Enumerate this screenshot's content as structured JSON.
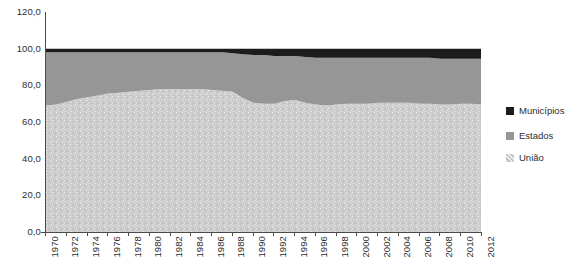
{
  "chart_data": {
    "type": "area",
    "stacked": true,
    "percent_stacked": true,
    "title": "",
    "subtitle": "",
    "xlabel": "",
    "ylabel": "",
    "grid": false,
    "legend_position": "right",
    "xlim": [
      1970,
      2012
    ],
    "ylim": [
      0,
      120
    ],
    "ytick_values": [
      0,
      20,
      40,
      60,
      80,
      100,
      120
    ],
    "ytick_labels": [
      "0,0",
      "20,0",
      "40,0",
      "60,0",
      "80,0",
      "100,0",
      "120,0"
    ],
    "xtick_labels": [
      "1970",
      "1972",
      "1974",
      "1976",
      "1978",
      "1980",
      "1982",
      "1984",
      "1986",
      "1988",
      "1990",
      "1992",
      "1994",
      "1996",
      "1998",
      "2000",
      "2002",
      "2004",
      "2006",
      "2008",
      "2010",
      "2012"
    ],
    "x": [
      1970,
      1971,
      1972,
      1973,
      1974,
      1975,
      1976,
      1977,
      1978,
      1979,
      1980,
      1981,
      1982,
      1983,
      1984,
      1985,
      1986,
      1987,
      1988,
      1989,
      1990,
      1991,
      1992,
      1993,
      1994,
      1995,
      1996,
      1997,
      1998,
      1999,
      2000,
      2001,
      2002,
      2003,
      2004,
      2005,
      2006,
      2007,
      2008,
      2009,
      2010,
      2011,
      2012
    ],
    "series": [
      {
        "name": "União",
        "color": "#c9c9c9",
        "pattern": "speckled-light",
        "values": [
          69.0,
          69.5,
          71.0,
          72.5,
          73.5,
          74.5,
          75.5,
          76.0,
          76.5,
          77.0,
          77.5,
          78.0,
          78.0,
          78.0,
          78.0,
          78.0,
          77.5,
          77.0,
          76.5,
          73.0,
          70.5,
          70.0,
          70.0,
          71.5,
          72.0,
          70.5,
          69.5,
          69.0,
          69.5,
          70.0,
          70.0,
          70.0,
          70.5,
          70.5,
          70.5,
          70.5,
          70.0,
          70.0,
          69.5,
          69.5,
          70.0,
          70.0,
          69.5
        ]
      },
      {
        "name": "Estados",
        "color": "#969696",
        "pattern": "solid-gray",
        "values": [
          29.0,
          28.5,
          27.0,
          25.5,
          24.5,
          23.5,
          22.5,
          22.0,
          21.5,
          21.0,
          20.5,
          20.0,
          20.0,
          20.0,
          20.0,
          20.0,
          20.5,
          21.0,
          21.0,
          24.0,
          26.0,
          26.5,
          26.0,
          24.5,
          24.0,
          25.0,
          25.5,
          26.0,
          25.5,
          25.0,
          25.0,
          25.0,
          24.5,
          24.5,
          24.5,
          24.5,
          25.0,
          25.0,
          25.0,
          25.0,
          24.5,
          24.5,
          25.0
        ]
      },
      {
        "name": "Municípios",
        "color": "#1c1c1c",
        "pattern": "solid-dark",
        "values": [
          2.0,
          2.0,
          2.0,
          2.0,
          2.0,
          2.0,
          2.0,
          2.0,
          2.0,
          2.0,
          2.0,
          2.0,
          2.0,
          2.0,
          2.0,
          2.0,
          2.0,
          2.0,
          2.5,
          3.0,
          3.5,
          3.5,
          4.0,
          4.0,
          4.0,
          4.5,
          5.0,
          5.0,
          5.0,
          5.0,
          5.0,
          5.0,
          5.0,
          5.0,
          5.0,
          5.0,
          5.0,
          5.0,
          5.5,
          5.5,
          5.5,
          5.5,
          5.5
        ]
      }
    ]
  },
  "legend": {
    "items": [
      {
        "label": "Municípios",
        "color": "#1c1c1c"
      },
      {
        "label": "Estados",
        "color": "#969696"
      },
      {
        "label": "União",
        "color": "#c9c9c9"
      }
    ]
  },
  "colors": {
    "municipios": "#1c1c1c",
    "estados": "#969696",
    "uniao": "#c9c9c9",
    "axis": "#4a4a4a",
    "text": "#2e2e2e",
    "background": "#ffffff"
  }
}
